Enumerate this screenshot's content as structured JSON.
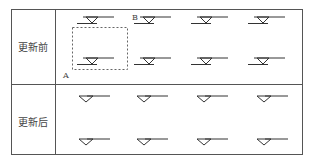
{
  "table": {
    "rows": [
      {
        "label": "更新前",
        "state": "before-update",
        "points": {
          "A": "A",
          "B": "B"
        }
      },
      {
        "label": "更新后",
        "state": "after-update"
      }
    ],
    "columns": 4
  },
  "colors": {
    "line": "#333333",
    "border": "#555555",
    "dashed": "#666666",
    "text": "#444444"
  }
}
